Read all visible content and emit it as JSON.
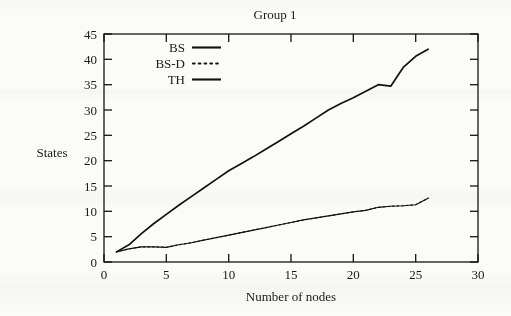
{
  "figure": {
    "title": "Group 1",
    "y_axis_label": "States",
    "x_axis_label": "Number of nodes"
  },
  "axes": {
    "x_ticks": [
      "0",
      "5",
      "10",
      "15",
      "20",
      "25",
      "30"
    ],
    "y_ticks": [
      "0",
      "5",
      "10",
      "15",
      "20",
      "25",
      "30",
      "35",
      "40",
      "45"
    ]
  },
  "legend": {
    "entries": [
      {
        "label": "BS",
        "style": "solid",
        "icon": "solid-line-icon"
      },
      {
        "label": "BS-D",
        "style": "dotted",
        "icon": "dotted-line-icon"
      },
      {
        "label": "TH",
        "style": "solid",
        "icon": "solid-line-icon"
      }
    ]
  },
  "colors": {
    "ink": "#111111",
    "paper": "#fbfbf9"
  },
  "chart_data": {
    "type": "line",
    "title": "Group 1",
    "xlabel": "Number of nodes",
    "ylabel": "States",
    "xlim": [
      0,
      30
    ],
    "ylim": [
      0,
      45
    ],
    "xticks": [
      0,
      5,
      10,
      15,
      20,
      25,
      30
    ],
    "yticks": [
      0,
      5,
      10,
      15,
      20,
      25,
      30,
      35,
      40,
      45
    ],
    "grid": false,
    "legend_position": "upper-left-inside",
    "series": [
      {
        "name": "TH",
        "style": "solid",
        "x": [
          1,
          2,
          3,
          4,
          5,
          6,
          7,
          8,
          9,
          10,
          11,
          12,
          13,
          14,
          15,
          16,
          17,
          18,
          19,
          20,
          21,
          22,
          23,
          24,
          25,
          26
        ],
        "y": [
          2.0,
          3.4,
          5.6,
          7.6,
          9.4,
          11.2,
          12.9,
          14.6,
          16.3,
          18.0,
          19.4,
          20.8,
          22.3,
          23.8,
          25.3,
          26.8,
          28.4,
          30.0,
          31.3,
          32.4,
          33.7,
          35.0,
          34.7,
          38.4,
          40.6,
          42.0
        ]
      },
      {
        "name": "BS",
        "style": "solid",
        "x": [
          1,
          2,
          3,
          4,
          5,
          6,
          7,
          8,
          9,
          10,
          11,
          12,
          13,
          14,
          15,
          16,
          17,
          18,
          19,
          20,
          21,
          22,
          23,
          24,
          25,
          26
        ],
        "y": [
          2.0,
          2.6,
          3.0,
          3.0,
          2.9,
          3.4,
          3.8,
          4.3,
          4.8,
          5.3,
          5.8,
          6.3,
          6.8,
          7.3,
          7.8,
          8.3,
          8.7,
          9.1,
          9.5,
          9.9,
          10.2,
          10.8,
          11.0,
          11.1,
          11.3,
          12.6
        ]
      },
      {
        "name": "BS-D",
        "style": "dotted",
        "note": "overlaps BS",
        "x": [
          1,
          2,
          3,
          4,
          5,
          6,
          7,
          8,
          9,
          10,
          11,
          12,
          13,
          14,
          15,
          16,
          17,
          18,
          19,
          20,
          21,
          22,
          23,
          24,
          25,
          26
        ],
        "y": [
          2.0,
          2.6,
          3.0,
          3.0,
          2.9,
          3.4,
          3.8,
          4.3,
          4.8,
          5.3,
          5.8,
          6.3,
          6.8,
          7.3,
          7.8,
          8.3,
          8.7,
          9.1,
          9.5,
          9.9,
          10.2,
          10.8,
          11.0,
          11.1,
          11.3,
          12.6
        ]
      }
    ]
  }
}
